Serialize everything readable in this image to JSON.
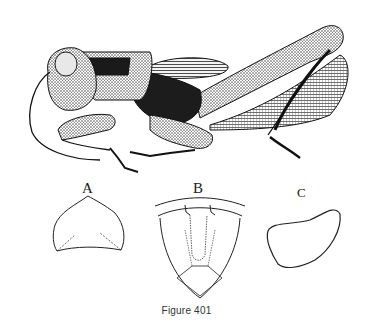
{
  "figure": {
    "caption": "Figure 401",
    "panels": [
      {
        "label": "A",
        "subject": "pronotum-outline"
      },
      {
        "label": "B",
        "subject": "pronotum-dorsal-outline"
      },
      {
        "label": "C",
        "subject": "lobe-outline"
      }
    ]
  },
  "colors": {
    "ink": "#1a1a1a",
    "paper": "#ffffff"
  }
}
